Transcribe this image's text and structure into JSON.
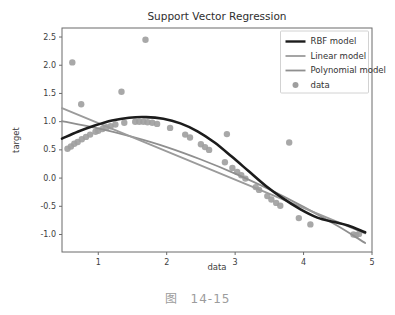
{
  "figure": {
    "caption_prefix": "图",
    "caption_number": "14-15"
  },
  "chart_data": {
    "type": "line",
    "title": "Support Vector Regression",
    "xlabel": "data",
    "ylabel": "target",
    "xlim": [
      0.47,
      5.0
    ],
    "ylim": [
      -1.31,
      2.66
    ],
    "xticks": [
      1,
      2,
      3,
      4,
      5
    ],
    "yticks": [
      2.5,
      2.0,
      1.5,
      1.0,
      0.5,
      0.0,
      -0.5,
      -1.0
    ],
    "grid": false,
    "legend": {
      "position": "upper right",
      "entries": [
        "RBF model",
        "Linear model",
        "Polynomial model",
        "data"
      ]
    },
    "colors": {
      "background": "#ffffff",
      "spine": "#6b6b6b",
      "tick_label": "#3d3d3d",
      "title": "#2e2e2e",
      "caption": "#9c9c9c",
      "legend_border": "#d2d2d2",
      "legend_text": "#333333"
    },
    "series": [
      {
        "name": "RBF model",
        "type": "line",
        "color": "#1c1c1c",
        "width": 2.6,
        "points": [
          [
            0.47,
            0.7
          ],
          [
            0.7,
            0.82
          ],
          [
            0.95,
            0.93
          ],
          [
            1.2,
            1.02
          ],
          [
            1.45,
            1.07
          ],
          [
            1.7,
            1.08
          ],
          [
            1.95,
            1.05
          ],
          [
            2.2,
            0.97
          ],
          [
            2.45,
            0.83
          ],
          [
            2.7,
            0.63
          ],
          [
            2.95,
            0.38
          ],
          [
            3.2,
            0.12
          ],
          [
            3.45,
            -0.14
          ],
          [
            3.7,
            -0.36
          ],
          [
            3.95,
            -0.55
          ],
          [
            4.2,
            -0.7
          ],
          [
            4.45,
            -0.78
          ],
          [
            4.65,
            -0.84
          ],
          [
            4.9,
            -0.96
          ]
        ]
      },
      {
        "name": "Linear model",
        "type": "line",
        "color": "#9b9b9b",
        "width": 1.8,
        "points": [
          [
            0.47,
            1.24
          ],
          [
            4.9,
            -0.98
          ]
        ]
      },
      {
        "name": "Polynomial model",
        "type": "line",
        "color": "#8f8f8f",
        "width": 1.8,
        "points": [
          [
            0.47,
            1.01
          ],
          [
            1.0,
            0.88
          ],
          [
            1.5,
            0.73
          ],
          [
            2.0,
            0.55
          ],
          [
            2.5,
            0.33
          ],
          [
            3.0,
            0.08
          ],
          [
            3.5,
            -0.2
          ],
          [
            4.0,
            -0.51
          ],
          [
            4.5,
            -0.85
          ],
          [
            4.9,
            -1.15
          ]
        ]
      },
      {
        "name": "data",
        "type": "scatter",
        "color": "#9e9e9e",
        "radius": 3.2,
        "points": [
          [
            0.55,
            0.52
          ],
          [
            0.6,
            0.56
          ],
          [
            0.62,
            2.05
          ],
          [
            0.65,
            0.61
          ],
          [
            0.7,
            0.64
          ],
          [
            0.75,
            1.31
          ],
          [
            0.76,
            0.69
          ],
          [
            0.82,
            0.73
          ],
          [
            0.88,
            0.77
          ],
          [
            0.96,
            0.82
          ],
          [
            1.0,
            0.84
          ],
          [
            1.06,
            0.87
          ],
          [
            1.12,
            0.9
          ],
          [
            1.18,
            0.92
          ],
          [
            1.25,
            0.95
          ],
          [
            1.34,
            1.53
          ],
          [
            1.38,
            0.98
          ],
          [
            1.54,
            1.0
          ],
          [
            1.6,
            1.0
          ],
          [
            1.66,
            1.0
          ],
          [
            1.69,
            2.45
          ],
          [
            1.72,
            0.99
          ],
          [
            1.79,
            0.98
          ],
          [
            1.86,
            0.96
          ],
          [
            2.05,
            0.89
          ],
          [
            2.27,
            0.77
          ],
          [
            2.34,
            0.72
          ],
          [
            2.5,
            0.6
          ],
          [
            2.56,
            0.55
          ],
          [
            2.62,
            0.5
          ],
          [
            2.85,
            0.28
          ],
          [
            2.88,
            0.78
          ],
          [
            2.96,
            0.18
          ],
          [
            3.03,
            0.11
          ],
          [
            3.09,
            0.05
          ],
          [
            3.15,
            -0.01
          ],
          [
            3.3,
            -0.16
          ],
          [
            3.35,
            -0.21
          ],
          [
            3.47,
            -0.32
          ],
          [
            3.53,
            -0.38
          ],
          [
            3.6,
            -0.44
          ],
          [
            3.66,
            -0.49
          ],
          [
            3.79,
            0.63
          ],
          [
            3.93,
            -0.71
          ],
          [
            4.1,
            -0.82
          ],
          [
            4.73,
            -1.0
          ],
          [
            4.77,
            -1.01
          ],
          [
            4.81,
            -0.99
          ]
        ]
      }
    ]
  }
}
